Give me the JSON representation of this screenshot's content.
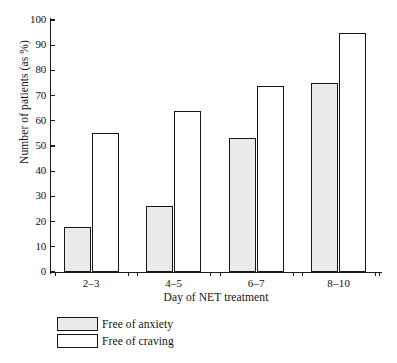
{
  "chart_data": {
    "type": "bar",
    "title": "",
    "subtitle": "",
    "xlabel": "Day of NET treatment",
    "ylabel": "Number of patients (as %)",
    "categories": [
      "2–3",
      "4–5",
      "6–7",
      "8–10"
    ],
    "series": [
      {
        "name": "Free of anxiety",
        "values": [
          18,
          26,
          53,
          75
        ],
        "fill": "#eaeaea",
        "stroke": "#161616"
      },
      {
        "name": "Free of craving",
        "values": [
          55,
          64,
          74,
          95
        ],
        "fill": "#ffffff",
        "stroke": "#161616"
      }
    ],
    "ylim": [
      0,
      100
    ],
    "ytick_values": [
      0,
      10,
      20,
      30,
      40,
      50,
      60,
      70,
      80,
      90,
      100
    ],
    "ytick_labels": [
      "0",
      "10",
      "20",
      "30",
      "40",
      "50",
      "60",
      "70",
      "80",
      "90",
      "100"
    ],
    "grid": false,
    "legend_position": "bottom-left",
    "legend_entries": [
      "Free of anxiety",
      "Free of craving"
    ],
    "background_color": "#ffffff",
    "axis_color": "#1b1b1b"
  }
}
